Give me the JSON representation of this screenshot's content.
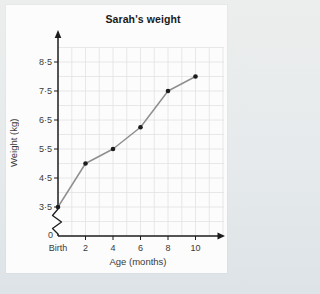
{
  "page": {
    "background": "#e6eaec",
    "card_background": "#fcfcfc"
  },
  "chart_data": {
    "type": "line",
    "title": "Sarah's weight",
    "xlabel": "Age (months)",
    "ylabel": "Weight (kg)",
    "x": [
      0,
      2,
      4,
      6,
      8,
      10
    ],
    "x_tick_labels": [
      "Birth",
      "2",
      "4",
      "6",
      "8",
      "10"
    ],
    "values": [
      3.5,
      5,
      5.5,
      6.25,
      7.5,
      8
    ],
    "y_tick_labels": [
      "3·5",
      "4·5",
      "5·5",
      "6·5",
      "7·5",
      "8·5"
    ],
    "y_tick_values": [
      3.5,
      4.5,
      5.5,
      6.5,
      7.5,
      8.5
    ],
    "origin_label": "0",
    "axis_break": true,
    "grid": true,
    "legend_position": "none",
    "xlim_months": [
      0,
      12
    ],
    "ylim_display": [
      3.5,
      8.5
    ],
    "colors": {
      "line": "#8f8f8f",
      "point": "#1c1c1c",
      "axis": "#1c1c1c",
      "grid": "#e2e2e2",
      "text": "#3a3a3a"
    }
  }
}
